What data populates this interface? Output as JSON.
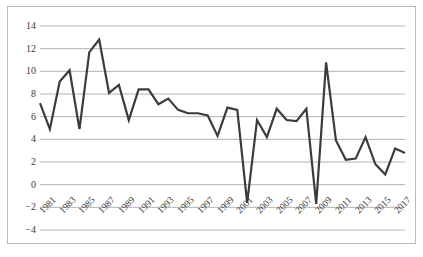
{
  "chart_data": {
    "type": "line",
    "title": "",
    "subtitle": "",
    "xlabel": "",
    "ylabel": "",
    "legend": [],
    "legend_position": "none",
    "grid": true,
    "grid_axis": "y",
    "xlim": [
      1981,
      2018
    ],
    "ylim": [
      -4,
      14
    ],
    "yticks": [
      -4,
      -2,
      0,
      2,
      4,
      6,
      8,
      10,
      12,
      14
    ],
    "ytick_labels": [
      "−4",
      "−2",
      "0",
      "2",
      "4",
      "6",
      "8",
      "10",
      "12",
      "14"
    ],
    "xticks": [
      1981,
      1983,
      1985,
      1987,
      1989,
      1991,
      1993,
      1995,
      1997,
      1999,
      2001,
      2003,
      2005,
      2007,
      2009,
      2011,
      2013,
      2015,
      2017
    ],
    "xtick_labels": [
      "1981",
      "1983",
      "1985",
      "1987",
      "1989",
      "1991",
      "1993",
      "1995",
      "1997",
      "1999",
      "2001",
      "2003",
      "2005",
      "2007",
      "2009",
      "2011",
      "2013",
      "2015",
      "2017"
    ],
    "xtick_rotation": -45,
    "line_color": "#3b3b3b",
    "line_width": 2.2,
    "grid_color": "#9e9e9e",
    "border_color": "#b9b9b9",
    "background_color": "#ffffff",
    "marker": "none",
    "x": [
      1981,
      1982,
      1983,
      1984,
      1985,
      1986,
      1987,
      1988,
      1989,
      1990,
      1991,
      1992,
      1993,
      1994,
      1995,
      1996,
      1997,
      1998,
      1999,
      2000,
      2001,
      2002,
      2003,
      2004,
      2005,
      2006,
      2007,
      2008,
      2009,
      2010,
      2011,
      2012,
      2013,
      2014,
      2015,
      2016,
      2017,
      2018
    ],
    "categories": [
      "1981",
      "1982",
      "1983",
      "1984",
      "1985",
      "1986",
      "1987",
      "1988",
      "1989",
      "1990",
      "1991",
      "1992",
      "1993",
      "1994",
      "1995",
      "1996",
      "1997",
      "1998",
      "1999",
      "2000",
      "2001",
      "2002",
      "2003",
      "2004",
      "2005",
      "2006",
      "2007",
      "2008",
      "2009",
      "2010",
      "2011",
      "2012",
      "2013",
      "2014",
      "2015",
      "2016",
      "2017",
      "2018"
    ],
    "values": [
      7.2,
      4.9,
      9.1,
      10.1,
      4.9,
      11.7,
      12.8,
      8.1,
      8.8,
      5.7,
      8.4,
      8.4,
      7.1,
      7.6,
      6.6,
      6.3,
      6.3,
      6.1,
      4.3,
      6.8,
      6.6,
      -1.6,
      5.7,
      4.2,
      6.7,
      5.7,
      5.6,
      6.7,
      -1.7,
      10.8,
      3.9,
      2.2,
      2.3,
      4.2,
      1.8,
      0.9,
      3.2,
      2.8
    ],
    "series": [
      {
        "name": "",
        "values": [
          7.2,
          4.9,
          9.1,
          10.1,
          4.9,
          11.7,
          12.8,
          8.1,
          8.8,
          5.7,
          8.4,
          8.4,
          7.1,
          7.6,
          6.6,
          6.3,
          6.3,
          6.1,
          4.3,
          6.8,
          6.6,
          -1.6,
          5.7,
          4.2,
          6.7,
          5.7,
          5.6,
          6.7,
          -1.7,
          10.8,
          3.9,
          2.2,
          2.3,
          4.2,
          1.8,
          0.9,
          3.2,
          2.8
        ]
      }
    ],
    "annotations": []
  }
}
